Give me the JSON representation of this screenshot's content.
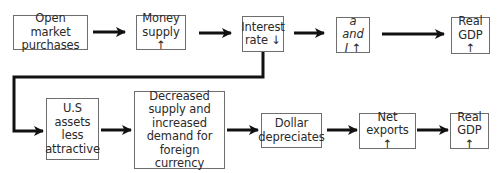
{
  "diagram": {
    "type": "flowchart",
    "top_row": [
      {
        "id": "open_market",
        "label": "Open market\npurchases"
      },
      {
        "id": "money_supply",
        "label": "Money\nsupply ↑"
      },
      {
        "id": "interest_rate",
        "label": "Interest\nrate ↓"
      },
      {
        "id": "a_and_i",
        "label": "a and\nI ↑",
        "italic": true
      },
      {
        "id": "real_gdp_top",
        "label": "Real\nGDP ↑"
      }
    ],
    "bottom_row": [
      {
        "id": "us_assets",
        "label": "U.S\nassets\nless\nattractive"
      },
      {
        "id": "currency",
        "label": "Decreased\nsupply and\nincreased\ndemand for\nforeign currency"
      },
      {
        "id": "dollar",
        "label": "Dollar\ndepreciates"
      },
      {
        "id": "net_exports",
        "label": "Net\nexports ↑"
      },
      {
        "id": "real_gdp_bottom",
        "label": "Real\nGDP ↑"
      }
    ],
    "edges": [
      [
        "open_market",
        "money_supply"
      ],
      [
        "money_supply",
        "interest_rate"
      ],
      [
        "interest_rate",
        "a_and_i"
      ],
      [
        "a_and_i",
        "real_gdp_top"
      ],
      [
        "interest_rate",
        "us_assets"
      ],
      [
        "us_assets",
        "currency"
      ],
      [
        "currency",
        "dollar"
      ],
      [
        "dollar",
        "net_exports"
      ],
      [
        "net_exports",
        "real_gdp_bottom"
      ]
    ],
    "colors": {
      "box_border": "#6e6e6e",
      "arrow": "#111111",
      "text": "#2a2a2a"
    }
  }
}
